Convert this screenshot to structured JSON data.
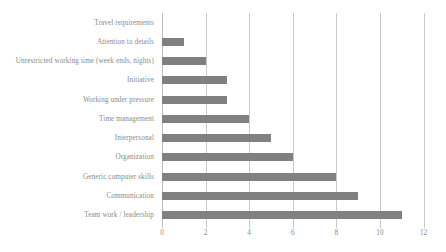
{
  "chart_data": {
    "type": "bar",
    "orientation": "horizontal",
    "title": "",
    "subtitle": "",
    "xlabel": "",
    "ylabel": "",
    "xlim": [
      0,
      12
    ],
    "xticks": [
      "0",
      "2",
      "4",
      "6",
      "8",
      "10",
      "12"
    ],
    "xtick_values": [
      0,
      2,
      4,
      6,
      8,
      10,
      12
    ],
    "grid": true,
    "legend": false,
    "legend_position": "none",
    "bar_color": "#808080",
    "grid_color": "#c9c9c9",
    "text_color": "#8a8a8a",
    "categories": [
      "Travel requirements",
      "Attention to details",
      "Unrestricted working time (week ends, nights)",
      "Initiative",
      "Working under pressure",
      "Time management",
      "Interpersonal",
      "Organization",
      "Generic computer skills",
      "Communication",
      "Team work / leadership"
    ],
    "values": [
      0,
      1,
      2,
      3,
      3,
      4,
      5,
      6,
      8,
      9,
      11
    ]
  }
}
